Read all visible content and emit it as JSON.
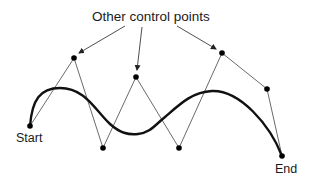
{
  "diagram": {
    "title_label": "Other control points",
    "start_label": "Start",
    "end_label": "End",
    "colors": {
      "ink": "#111111",
      "polygon": "#333333",
      "background": "#ffffff"
    },
    "points": {
      "start": {
        "x": 30,
        "y": 126
      },
      "control": [
        {
          "x": 74,
          "y": 58
        },
        {
          "x": 103,
          "y": 148
        },
        {
          "x": 136,
          "y": 77
        },
        {
          "x": 179,
          "y": 148
        },
        {
          "x": 222,
          "y": 53
        },
        {
          "x": 267,
          "y": 89
        }
      ],
      "end": {
        "x": 282,
        "y": 156
      }
    }
  }
}
